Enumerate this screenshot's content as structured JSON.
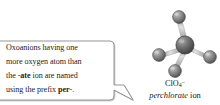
{
  "figure": {
    "kind": "chemistry-annotated-molecule-figure",
    "background_color": "#ffffff"
  },
  "callout": {
    "border_color": "#8a8a8a",
    "fill_color": "#ffffff",
    "text_color": "#1d1d1d",
    "lines": [
      {
        "segments": [
          {
            "text": "Oxoanions having one",
            "bold": false
          }
        ]
      },
      {
        "segments": [
          {
            "text": "more oxygen atom than",
            "bold": false
          }
        ]
      },
      {
        "segments": [
          {
            "text": "the -",
            "bold": false
          },
          {
            "text": "ate",
            "bold": true
          },
          {
            "text": " ion are named",
            "bold": false
          }
        ]
      },
      {
        "segments": [
          {
            "text": "using the prefix ",
            "bold": false
          },
          {
            "text": "per",
            "bold": true
          },
          {
            "text": "-.",
            "bold": false
          }
        ]
      }
    ],
    "full_text": "Oxoanions having one more oxygen atom than the -ate ion are named using the prefix per-."
  },
  "molecule": {
    "name": "perchlorate-ion-ball-and-stick",
    "geometry": "tetrahedral",
    "center_atom": {
      "element": "Cl",
      "color": "#6b6b6b",
      "radius": 8.4
    },
    "outer_atoms": [
      {
        "element": "O",
        "color": "#8e8e8e",
        "radius": 6.2,
        "position": "top"
      },
      {
        "element": "O",
        "color": "#8e8e8e",
        "radius": 6.2,
        "position": "left"
      },
      {
        "element": "O",
        "color": "#8e8e8e",
        "radius": 6.2,
        "position": "right"
      },
      {
        "element": "O",
        "color": "#8e8e8e",
        "radius": 6.2,
        "position": "bottom-left-front"
      }
    ],
    "bond_color": "#b4b4b4"
  },
  "caption": {
    "formula_symbol": "ClO",
    "formula_subscript": "4",
    "formula_superscript": "−",
    "ion_name_italic": "perchlorate",
    "ion_name_roman": " ion"
  }
}
